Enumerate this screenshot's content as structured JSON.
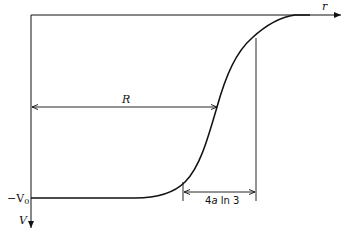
{
  "diagram": {
    "title": "",
    "axes": {
      "x_label": "r",
      "y_label": "V",
      "y_level_label": "−V",
      "y_level_subscript": "0"
    },
    "annotations": {
      "radius_label": "R",
      "width_label_prefix": "4",
      "width_label_var": "a",
      "width_label_suffix": " ln 3"
    },
    "curve": {
      "type": "Woods-Saxon potential",
      "description": "Potential V(r) flat at −V0 inside nucleus, rising sigmoidally to 0 around r = R"
    }
  }
}
